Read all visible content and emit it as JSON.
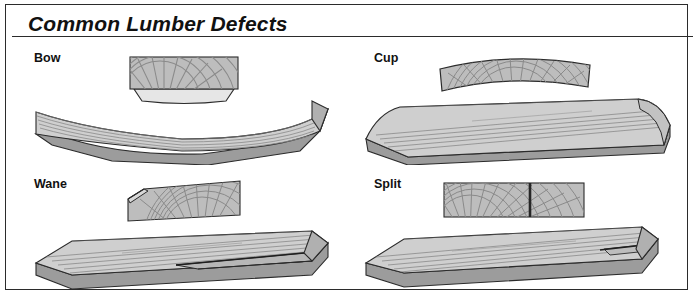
{
  "figure": {
    "title": "Common Lumber Defects",
    "border_color": "#2b2b2b",
    "background_color": "#ffffff"
  },
  "palette": {
    "wood_face_light": "#d2d2d2",
    "wood_face_mid": "#bcbcbc",
    "wood_edge_dark": "#9a9a9a",
    "wood_edge_darker": "#868686",
    "grain_line": "#8c8c8c",
    "outline": "#2b2b2b",
    "split_crack": "#2b2b2b",
    "wane_facet": "#e4e4e4"
  },
  "quadrants": [
    {
      "id": "bow",
      "label": "Bow",
      "end_view": "rectangular-end-grain-block-with-arc-rings",
      "board_view": "long-board-curved-downward-along-length"
    },
    {
      "id": "cup",
      "label": "Cup",
      "end_view": "cupped-cross-section-block-curved-upward",
      "board_view": "long-board-with-curled-up-edges"
    },
    {
      "id": "wane",
      "label": "Wane",
      "end_view": "block-with-beveled-missing-top-left-corner",
      "board_view": "long-board-with-tapered-missing-edge-near-right-end"
    },
    {
      "id": "split",
      "label": "Split",
      "end_view": "rectangular-block-with-vertical-crack",
      "board_view": "long-board-with-lengthwise-crack-at-right-end"
    }
  ]
}
